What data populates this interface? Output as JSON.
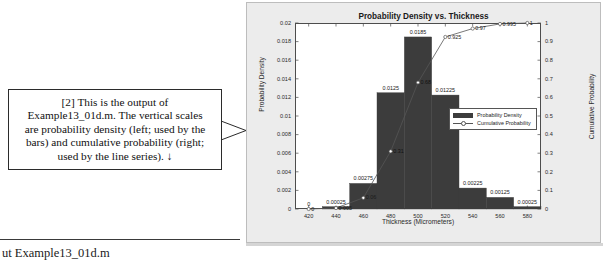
{
  "annotation": {
    "callout_text": "[2] This is the output of\nExample13_01d.m.  The vertical scales\nare probability density (left; used by the\nbars) and cumulative probability (right;\nused by the line series).  ↓",
    "bottom_caption": "ut Example13_01d.m"
  },
  "chart_data": {
    "type": "bar",
    "title": "Probability Density vs. Thickness",
    "xlabel": "Thickness (Micrometers)",
    "ylabel": "Probability Density",
    "y2label": "Cumulative Probability",
    "categories": [
      420,
      440,
      460,
      480,
      500,
      520,
      540,
      560,
      580
    ],
    "xlim": [
      410,
      590
    ],
    "xticks": [
      "420",
      "440",
      "460",
      "480",
      "500",
      "520",
      "540",
      "560",
      "580"
    ],
    "ylim": [
      0,
      0.02
    ],
    "yticks": [
      "0",
      "0.002",
      "0.004",
      "0.006",
      "0.008",
      "0.01",
      "0.012",
      "0.014",
      "0.016",
      "0.018",
      "0.02"
    ],
    "y2lim": [
      0,
      1
    ],
    "y2ticks": [
      "0",
      "0.1",
      "0.2",
      "0.3",
      "0.4",
      "0.5",
      "0.6",
      "0.7",
      "0.8",
      "0.9",
      "1"
    ],
    "grid": false,
    "legend_position": "center-right",
    "series": [
      {
        "name": "Probability Density",
        "axis": "left",
        "kind": "bar",
        "values": [
          0,
          0.00025,
          0.00275,
          0.0125,
          0.0185,
          0.01225,
          0.00225,
          0.00125,
          0.00025
        ],
        "labels": [
          "0",
          "0.00025",
          "0.00275",
          "0.0125",
          "0.0185",
          "0.01225",
          "0.00225",
          "0.00125",
          "0.00025"
        ]
      },
      {
        "name": "Cumulative Probability",
        "axis": "right",
        "kind": "line",
        "values": [
          0,
          0.005,
          0.06,
          0.31,
          0.68,
          0.925,
          0.97,
          0.995,
          1
        ],
        "labels": [
          "0",
          "0.005",
          "0.06",
          "0.31",
          "0.68",
          "0.925",
          "0.97",
          "0.995",
          "1"
        ]
      }
    ],
    "legend": [
      "Probability Density",
      "Cumulative Probability"
    ],
    "colors": {
      "bar_fill": "#3c3c3c",
      "line": "#555555",
      "axes": "#4d4d4d",
      "figure_background": "#ececec",
      "plot_background": "#ffffff"
    }
  }
}
